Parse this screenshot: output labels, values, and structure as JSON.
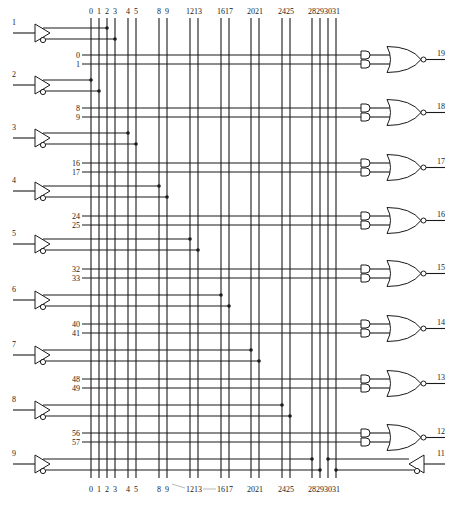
{
  "column_labels": [
    "0",
    "1",
    "2",
    "3",
    "4",
    "5",
    "8",
    "9",
    "12",
    "13",
    "16",
    "17",
    "20",
    "21",
    "24",
    "25",
    "28",
    "29",
    "30",
    "31"
  ],
  "column_x": [
    91,
    99,
    107,
    115,
    128,
    136,
    159,
    167,
    190,
    198,
    221,
    229,
    251,
    259,
    282,
    290,
    312,
    320,
    328,
    336
  ],
  "inputs": [
    {
      "label": "1",
      "pin": 1,
      "y": 28,
      "true_col": 2,
      "comp_col": 3
    },
    {
      "label": "2",
      "pin": 2,
      "y": 80,
      "true_col": 0,
      "comp_col": 1
    },
    {
      "label": "3",
      "pin": 3,
      "y": 133,
      "true_col": 4,
      "comp_col": 5
    },
    {
      "label": "4",
      "pin": 4,
      "y": 186,
      "true_col": 6,
      "comp_col": 7
    },
    {
      "label": "5",
      "pin": 5,
      "y": 239,
      "true_col": 8,
      "comp_col": 9
    },
    {
      "label": "6",
      "pin": 6,
      "y": 295,
      "true_col": 10,
      "comp_col": 11
    },
    {
      "label": "7",
      "pin": 7,
      "y": 350,
      "true_col": 12,
      "comp_col": 13
    },
    {
      "label": "8",
      "pin": 8,
      "y": 405,
      "true_col": 14,
      "comp_col": 15
    },
    {
      "label": "9",
      "pin": 9,
      "y": 459,
      "true_col": 16,
      "comp_col": 17
    }
  ],
  "product_terms": [
    {
      "rows": [
        "0",
        "1"
      ],
      "y": 55,
      "output": "19"
    },
    {
      "rows": [
        "8",
        "9"
      ],
      "y": 108,
      "output": "18"
    },
    {
      "rows": [
        "16",
        "17"
      ],
      "y": 163,
      "output": "17"
    },
    {
      "rows": [
        "24",
        "25"
      ],
      "y": 216,
      "output": "16"
    },
    {
      "rows": [
        "32",
        "33"
      ],
      "y": 269,
      "output": "15"
    },
    {
      "rows": [
        "40",
        "41"
      ],
      "y": 324,
      "output": "14"
    },
    {
      "rows": [
        "48",
        "49"
      ],
      "y": 379,
      "output": "13"
    },
    {
      "rows": [
        "56",
        "57"
      ],
      "y": 433,
      "output": "12"
    }
  ],
  "feedback_input": {
    "label": "11",
    "y": 459,
    "true_col": 18,
    "comp_col": 19
  },
  "bottom_note": "12-13—16 17",
  "colors": {
    "line": "#1a1a1a",
    "background": "#ffffff"
  }
}
